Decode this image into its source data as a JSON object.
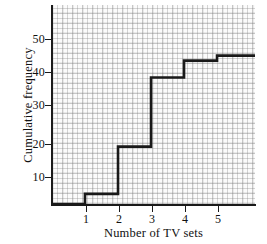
{
  "chart_data": {
    "type": "line",
    "subtype": "cumulative-frequency-step",
    "title": "",
    "xlabel": "Number of TV sets",
    "ylabel": "Cumulative frequency",
    "xlim": [
      0.0,
      6.15
    ],
    "ylim": [
      0,
      59
    ],
    "xticks": [
      1,
      2,
      3,
      4,
      5
    ],
    "xticklabels": [
      "1",
      "2",
      "3",
      "4",
      "5"
    ],
    "yticks": [
      10,
      20,
      30,
      40,
      50
    ],
    "yticklabels": [
      "10",
      "20",
      "30",
      "40",
      "50"
    ],
    "grid": true,
    "legend": false,
    "x": [
      1,
      2,
      3,
      4,
      5
    ],
    "values": [
      3,
      17,
      37.5,
      42.5,
      44
    ],
    "series": [
      {
        "name": "Cumulative frequency",
        "color": "#1a1a1a",
        "steps": [
          {
            "x": 1,
            "y": 3
          },
          {
            "x": 2,
            "y": 17
          },
          {
            "x": 3,
            "y": 37.5
          },
          {
            "x": 4,
            "y": 42.5
          },
          {
            "x": 5,
            "y": 44
          }
        ]
      }
    ],
    "baseline_y": 0,
    "line_extends_to_right_edge": true
  },
  "axes": {
    "x_title": "Number of TV sets",
    "y_title": "Cumulative frequency",
    "x_tick_labels": [
      "1",
      "2",
      "3",
      "4",
      "5"
    ],
    "y_tick_labels": [
      "10",
      "20",
      "30",
      "40",
      "50"
    ]
  },
  "style": {
    "line_color": "#1a1a1a",
    "axis_color": "#1a1a1a",
    "plot_background": "#fbfbfb",
    "grid_color": "#b4b4b4",
    "page_background": "#ffffff"
  }
}
